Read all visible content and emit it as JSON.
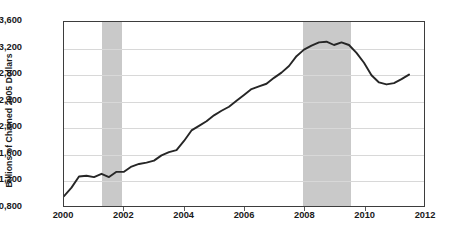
{
  "chart_data": {
    "type": "line",
    "title": "",
    "xlabel": "",
    "ylabel": "Billions of Chained 2005 Dollars",
    "xlim": [
      2000,
      2012
    ],
    "ylim": [
      10800,
      13600
    ],
    "grid": true,
    "legend": "none",
    "y_ticks": [
      "13,600",
      "13,200",
      "12,800",
      "12,400",
      "12,000",
      "11,600",
      "11,200",
      "10,800"
    ],
    "y_tick_values": [
      13600,
      13200,
      12800,
      12400,
      12000,
      11600,
      11200,
      10800
    ],
    "x_ticks": [
      "2000",
      "2002",
      "2004",
      "2006",
      "2008",
      "2010",
      "2012"
    ],
    "x_tick_values": [
      2000,
      2002,
      2004,
      2006,
      2008,
      2010,
      2012
    ],
    "series": [
      {
        "name": "Real GDP",
        "color": "#262626",
        "x": [
          2000.0,
          2000.25,
          2000.5,
          2000.75,
          2001.0,
          2001.25,
          2001.5,
          2001.75,
          2002.0,
          2002.25,
          2002.5,
          2002.75,
          2003.0,
          2003.25,
          2003.5,
          2003.75,
          2004.0,
          2004.25,
          2004.5,
          2004.75,
          2005.0,
          2005.25,
          2005.5,
          2005.75,
          2006.0,
          2006.25,
          2006.5,
          2006.75,
          2007.0,
          2007.25,
          2007.5,
          2007.75,
          2008.0,
          2008.25,
          2008.5,
          2008.75,
          2009.0,
          2009.25,
          2009.5,
          2009.75,
          2010.0,
          2010.25,
          2010.5,
          2010.75,
          2011.0,
          2011.25,
          2011.5
        ],
        "values": [
          10950,
          11080,
          11250,
          11260,
          11240,
          11290,
          11240,
          11320,
          11320,
          11400,
          11440,
          11460,
          11490,
          11570,
          11620,
          11650,
          11790,
          11950,
          12020,
          12090,
          12180,
          12250,
          12310,
          12400,
          12490,
          12580,
          12620,
          12660,
          12750,
          12830,
          12930,
          13080,
          13180,
          13240,
          13290,
          13300,
          13250,
          13290,
          13250,
          13130,
          12980,
          12790,
          12680,
          12650,
          12670,
          12730,
          12800
        ]
      }
    ],
    "annotations": {
      "recession_bands": [
        {
          "name": "recession-2001",
          "start": 2001.25,
          "end": 2001.92,
          "color": "#c9c9c9"
        },
        {
          "name": "recession-2008",
          "start": 2007.92,
          "end": 2009.5,
          "color": "#c9c9c9"
        }
      ]
    },
    "caption": ""
  }
}
